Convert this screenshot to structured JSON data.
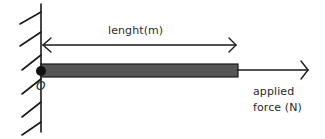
{
  "diagram": {
    "labels": {
      "length": "lenght(m)",
      "origin": "O",
      "force_line1": "applied",
      "force_line2": "force (N)"
    },
    "colors": {
      "stroke": "#1a1a1a",
      "bar_fill": "#555555",
      "bar_edge": "#1a1a1a",
      "pivot": "#111111",
      "text": "#2a2a2a"
    },
    "elements": {
      "wall": {
        "x": 41,
        "y_top": 4,
        "y_bottom": 132,
        "hatch_count": 6
      },
      "bar": {
        "x_start": 41,
        "x_end": 238,
        "y_top": 64,
        "y_bottom": 77
      },
      "pivot": {
        "cx": 41,
        "cy": 71,
        "r": 5
      },
      "length_arrow": {
        "x_start": 43,
        "x_end": 236,
        "y": 45
      },
      "force_arrow": {
        "x_start": 238,
        "x_end": 308,
        "y": 70
      }
    }
  }
}
